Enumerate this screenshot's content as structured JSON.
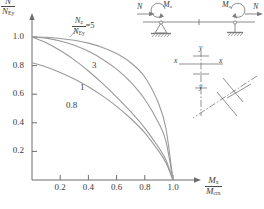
{
  "figure": {
    "kind": "beam-column interaction diagram",
    "axes": {
      "y_label_numerator": "N",
      "y_label_numerator_sub": "",
      "y_label_denominator": "N",
      "y_label_denominator_sub": "Ey",
      "x_label_numerator": "M",
      "x_label_numerator_sub": "x",
      "x_label_denominator": "M",
      "x_label_denominator_sub": "crx",
      "y_ticks": [
        "0.2",
        "0.4",
        "0.6",
        "0.8",
        "1.0"
      ],
      "x_ticks": [
        "0.2",
        "0.4",
        "0.6",
        "0.8",
        "1.0"
      ]
    },
    "legend": {
      "numerator": "N",
      "numerator_sub": "z",
      "denominator": "N",
      "denominator_sub": "Ey",
      "equals": "=5"
    },
    "curve_labels": [
      "5",
      "3",
      "1",
      "0.8"
    ],
    "beam": {
      "axial_left": "N",
      "moment_left": "M",
      "moment_left_sub": "x",
      "moment_right": "M",
      "moment_right_sub": "x",
      "axial_right": "N"
    },
    "section": {
      "axis_top": "y",
      "axis_left": "x",
      "axis_right": "x",
      "axis_bottom": "y"
    },
    "colors": {
      "curve": "#9a9a9a",
      "axis": "#6d6d6d",
      "text": "#3a3a3a",
      "sketch": "#7d7d7d"
    }
  },
  "chart_data": {
    "type": "line",
    "title": "",
    "xlabel": "Mx / Mcrx",
    "ylabel": "N / NEy",
    "xlim": [
      0,
      1.12
    ],
    "ylim": [
      0,
      1.1
    ],
    "grid": false,
    "legend_position": "inline-annotations",
    "series": [
      {
        "name": "5",
        "label": "Nz/NEy = 5",
        "x": [
          0.0,
          0.1,
          0.2,
          0.3,
          0.4,
          0.5,
          0.6,
          0.7,
          0.8,
          0.9,
          0.95,
          1.0
        ],
        "y": [
          1.0,
          0.998,
          0.99,
          0.977,
          0.957,
          0.927,
          0.884,
          0.82,
          0.72,
          0.53,
          0.36,
          0.0
        ]
      },
      {
        "name": "3",
        "label": "Nz/NEy = 3",
        "x": [
          0.0,
          0.1,
          0.2,
          0.3,
          0.4,
          0.5,
          0.6,
          0.7,
          0.8,
          0.9,
          0.95,
          1.0
        ],
        "y": [
          1.0,
          0.992,
          0.972,
          0.942,
          0.9,
          0.845,
          0.775,
          0.685,
          0.565,
          0.395,
          0.27,
          0.0
        ]
      },
      {
        "name": "1",
        "label": "Nz/NEy = 1",
        "x": [
          0.0,
          0.1,
          0.2,
          0.3,
          0.4,
          0.5,
          0.6,
          0.7,
          0.8,
          0.9,
          0.95,
          1.0
        ],
        "y": [
          1.0,
          0.96,
          0.905,
          0.84,
          0.762,
          0.675,
          0.58,
          0.478,
          0.363,
          0.225,
          0.14,
          0.0
        ]
      },
      {
        "name": "0.8",
        "label": "Nz/NEy = 0.8",
        "x": [
          0.0,
          0.1,
          0.2,
          0.3,
          0.4,
          0.5,
          0.6,
          0.7,
          0.8,
          0.9,
          0.95,
          1.0
        ],
        "y": [
          0.82,
          0.79,
          0.752,
          0.706,
          0.652,
          0.588,
          0.515,
          0.43,
          0.33,
          0.2,
          0.12,
          0.0
        ]
      }
    ]
  }
}
